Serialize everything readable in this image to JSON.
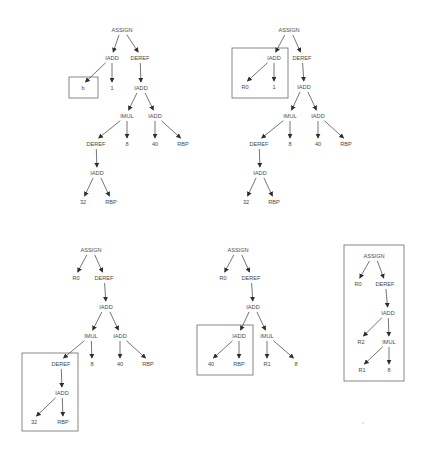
{
  "diagram": {
    "title": "",
    "trees": [
      {
        "id": "tree-1",
        "nodes": [
          {
            "id": "a",
            "label": "ASSIGN",
            "x": 122,
            "y": 30
          },
          {
            "id": "b",
            "label": "IADD",
            "x": 112,
            "y": 58
          },
          {
            "id": "c",
            "label": "DEREF",
            "x": 140,
            "y": 58
          },
          {
            "id": "d",
            "label": "b",
            "x": 83,
            "y": 88
          },
          {
            "id": "e",
            "label": "1",
            "x": 112,
            "y": 88
          },
          {
            "id": "f",
            "label": "IADD",
            "x": 141,
            "y": 88
          },
          {
            "id": "g",
            "label": "IMUL",
            "x": 127,
            "y": 116
          },
          {
            "id": "h",
            "label": "IADD",
            "x": 155,
            "y": 116
          },
          {
            "id": "i",
            "label": "DEREF",
            "x": 96,
            "y": 144
          },
          {
            "id": "j",
            "label": "8",
            "x": 127,
            "y": 144
          },
          {
            "id": "k",
            "label": "40",
            "x": 155,
            "y": 144
          },
          {
            "id": "l",
            "label": "RBP",
            "x": 183,
            "y": 144
          },
          {
            "id": "m",
            "label": "IADD",
            "x": 97,
            "y": 173
          },
          {
            "id": "n",
            "label": "32",
            "x": 83,
            "y": 202
          },
          {
            "id": "o",
            "label": "RBP",
            "x": 111,
            "y": 202
          }
        ],
        "edges": [
          [
            "a",
            "b"
          ],
          [
            "a",
            "c"
          ],
          [
            "b",
            "d"
          ],
          [
            "b",
            "e"
          ],
          [
            "c",
            "f"
          ],
          [
            "f",
            "g"
          ],
          [
            "f",
            "h"
          ],
          [
            "g",
            "i"
          ],
          [
            "g",
            "j"
          ],
          [
            "h",
            "k"
          ],
          [
            "h",
            "l"
          ],
          [
            "i",
            "m"
          ],
          [
            "m",
            "n"
          ],
          [
            "m",
            "o"
          ]
        ],
        "highlight_boxes": [
          {
            "x": 69,
            "y": 77,
            "w": 29,
            "h": 21,
            "covers": "b"
          }
        ]
      },
      {
        "id": "tree-2",
        "nodes": [
          {
            "id": "a",
            "label": "ASSIGN",
            "x": 289,
            "y": 30
          },
          {
            "id": "b",
            "label": "IADD",
            "x": 274,
            "y": 58
          },
          {
            "id": "c",
            "label": "DEREF",
            "x": 302,
            "y": 58
          },
          {
            "id": "d",
            "label": "R0",
            "x": 245,
            "y": 87
          },
          {
            "id": "e",
            "label": "1",
            "x": 274,
            "y": 87
          },
          {
            "id": "f",
            "label": "IADD",
            "x": 304,
            "y": 87
          },
          {
            "id": "g",
            "label": "IMUL",
            "x": 290,
            "y": 116
          },
          {
            "id": "h",
            "label": "IADD",
            "x": 318,
            "y": 116
          },
          {
            "id": "i",
            "label": "DEREF",
            "x": 259,
            "y": 144
          },
          {
            "id": "j",
            "label": "8",
            "x": 290,
            "y": 144
          },
          {
            "id": "k",
            "label": "40",
            "x": 318,
            "y": 144
          },
          {
            "id": "l",
            "label": "RBP",
            "x": 346,
            "y": 144
          },
          {
            "id": "m",
            "label": "IADD",
            "x": 260,
            "y": 173
          },
          {
            "id": "n",
            "label": "32",
            "x": 246,
            "y": 202
          },
          {
            "id": "o",
            "label": "RBP",
            "x": 274,
            "y": 202
          }
        ],
        "edges": [
          [
            "a",
            "b"
          ],
          [
            "a",
            "c"
          ],
          [
            "b",
            "d"
          ],
          [
            "b",
            "e"
          ],
          [
            "c",
            "f"
          ],
          [
            "f",
            "g"
          ],
          [
            "f",
            "h"
          ],
          [
            "g",
            "i"
          ],
          [
            "g",
            "j"
          ],
          [
            "h",
            "k"
          ],
          [
            "h",
            "l"
          ],
          [
            "i",
            "m"
          ],
          [
            "m",
            "n"
          ],
          [
            "m",
            "o"
          ]
        ],
        "highlight_boxes": [
          {
            "x": 232,
            "y": 48,
            "w": 56,
            "h": 50,
            "covers": "IADD(R0, 1)"
          }
        ]
      },
      {
        "id": "tree-3",
        "nodes": [
          {
            "id": "a",
            "label": "ASSIGN",
            "x": 91,
            "y": 250
          },
          {
            "id": "b",
            "label": "R0",
            "x": 76,
            "y": 278
          },
          {
            "id": "c",
            "label": "DEREF",
            "x": 104,
            "y": 278
          },
          {
            "id": "f",
            "label": "IADD",
            "x": 106,
            "y": 307
          },
          {
            "id": "g",
            "label": "IMUL",
            "x": 91,
            "y": 336
          },
          {
            "id": "h",
            "label": "IADD",
            "x": 120,
            "y": 336
          },
          {
            "id": "i",
            "label": "DEREF",
            "x": 61,
            "y": 364
          },
          {
            "id": "j",
            "label": "8",
            "x": 92,
            "y": 364
          },
          {
            "id": "k",
            "label": "40",
            "x": 120,
            "y": 364
          },
          {
            "id": "l",
            "label": "RBP",
            "x": 148,
            "y": 364
          },
          {
            "id": "m",
            "label": "IADD",
            "x": 62,
            "y": 393
          },
          {
            "id": "n",
            "label": "32",
            "x": 34,
            "y": 422
          },
          {
            "id": "o",
            "label": "RBP",
            "x": 63,
            "y": 422
          }
        ],
        "edges": [
          [
            "a",
            "b"
          ],
          [
            "a",
            "c"
          ],
          [
            "c",
            "f"
          ],
          [
            "f",
            "g"
          ],
          [
            "f",
            "h"
          ],
          [
            "g",
            "i"
          ],
          [
            "g",
            "j"
          ],
          [
            "h",
            "k"
          ],
          [
            "h",
            "l"
          ],
          [
            "i",
            "m"
          ],
          [
            "m",
            "n"
          ],
          [
            "m",
            "o"
          ]
        ],
        "highlight_boxes": [
          {
            "x": 22,
            "y": 353,
            "w": 56,
            "h": 78,
            "covers": "DEREF(IADD(32, RBP))"
          }
        ]
      },
      {
        "id": "tree-4",
        "nodes": [
          {
            "id": "a",
            "label": "ASSIGN",
            "x": 238,
            "y": 250
          },
          {
            "id": "b",
            "label": "R0",
            "x": 223,
            "y": 278
          },
          {
            "id": "c",
            "label": "DEREF",
            "x": 251,
            "y": 278
          },
          {
            "id": "f",
            "label": "IADD",
            "x": 253,
            "y": 307
          },
          {
            "id": "g",
            "label": "IADD",
            "x": 239,
            "y": 336
          },
          {
            "id": "h",
            "label": "IMUL",
            "x": 267,
            "y": 336
          },
          {
            "id": "k",
            "label": "40",
            "x": 211,
            "y": 364
          },
          {
            "id": "l",
            "label": "RBP",
            "x": 239,
            "y": 364
          },
          {
            "id": "r",
            "label": "R1",
            "x": 267,
            "y": 364
          },
          {
            "id": "j",
            "label": "8",
            "x": 296,
            "y": 364
          }
        ],
        "edges": [
          [
            "a",
            "b"
          ],
          [
            "a",
            "c"
          ],
          [
            "c",
            "f"
          ],
          [
            "f",
            "g"
          ],
          [
            "f",
            "h"
          ],
          [
            "g",
            "k"
          ],
          [
            "g",
            "l"
          ],
          [
            "h",
            "r"
          ],
          [
            "h",
            "j"
          ]
        ],
        "highlight_boxes": [
          {
            "x": 197,
            "y": 325,
            "w": 56,
            "h": 50,
            "covers": "IADD(40, RBP)"
          }
        ]
      },
      {
        "id": "tree-5",
        "nodes": [
          {
            "id": "a",
            "label": "ASSIGN",
            "x": 374,
            "y": 256
          },
          {
            "id": "b",
            "label": "R0",
            "x": 358,
            "y": 284
          },
          {
            "id": "c",
            "label": "DEREF",
            "x": 385,
            "y": 284
          },
          {
            "id": "f",
            "label": "IADD",
            "x": 388,
            "y": 313
          },
          {
            "id": "g",
            "label": "R2",
            "x": 361,
            "y": 342
          },
          {
            "id": "h",
            "label": "IMUL",
            "x": 389,
            "y": 342
          },
          {
            "id": "r",
            "label": "R1",
            "x": 362,
            "y": 370
          },
          {
            "id": "j",
            "label": "8",
            "x": 389,
            "y": 370
          }
        ],
        "edges": [
          [
            "a",
            "b"
          ],
          [
            "a",
            "c"
          ],
          [
            "c",
            "f"
          ],
          [
            "f",
            "g"
          ],
          [
            "f",
            "h"
          ],
          [
            "h",
            "r"
          ],
          [
            "h",
            "j"
          ]
        ],
        "highlight_boxes": [
          {
            "x": 344,
            "y": 245,
            "w": 60,
            "h": 136,
            "covers": "entire tree"
          }
        ]
      }
    ]
  }
}
